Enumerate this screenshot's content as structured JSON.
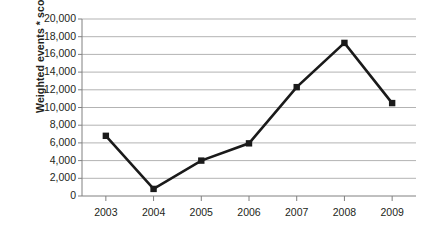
{
  "chart_data": {
    "type": "line",
    "title": "",
    "xlabel": "",
    "ylabel": "Weighted events * scope",
    "categories": [
      "2003",
      "2004",
      "2005",
      "2006",
      "2007",
      "2008",
      "2009"
    ],
    "x": [
      2003,
      2004,
      2005,
      2006,
      2007,
      2008,
      2009
    ],
    "values": [
      6800,
      800,
      4000,
      5950,
      12300,
      17300,
      10500
    ],
    "series": [
      {
        "name": "Weighted events * scope",
        "values": [
          6800,
          800,
          4000,
          5950,
          12300,
          17300,
          10500
        ]
      }
    ],
    "ylim": [
      0,
      20000
    ],
    "ytick_labels": [
      "0",
      "2,000",
      "4,000",
      "6,000",
      "8,000",
      "10,000",
      "12,000",
      "14,000",
      "16,000",
      "18,000",
      "20,000"
    ],
    "ytick_values": [
      0,
      2000,
      4000,
      6000,
      8000,
      10000,
      12000,
      14000,
      16000,
      18000,
      20000
    ],
    "grid": true,
    "grid_axis": "y",
    "legend": false,
    "legend_position": "none",
    "marker": "square",
    "line_color": "#1a1a1a",
    "marker_color": "#1a1a1a",
    "grid_color": "#b3b3b3",
    "axis_color": "#808080",
    "text_color": "#231f20",
    "background": "#ffffff"
  }
}
